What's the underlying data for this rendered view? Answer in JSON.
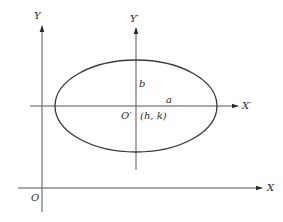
{
  "diagram": {
    "colors": {
      "stroke": "#3a3a3a",
      "axis": "#555555",
      "text": "#2a2a2a",
      "background": "#ffffff"
    },
    "axes": {
      "original_x": {
        "label": "X",
        "y": 188,
        "x_start": 18,
        "x_end": 262
      },
      "original_y": {
        "label": "Y",
        "x": 42,
        "y_start": 212,
        "y_end": 26
      },
      "translated_x": {
        "label": "X′",
        "y": 106,
        "x_start": 30,
        "x_end": 238
      },
      "translated_y": {
        "label": "Y′",
        "x": 136,
        "y_start": 170,
        "y_end": 28
      }
    },
    "ellipse": {
      "cx": 136,
      "cy": 106,
      "rx": 81,
      "ry": 46
    },
    "labels": {
      "origin": "O",
      "new_origin": "O′",
      "center_coords": "(h, k)",
      "semi_major": "a",
      "semi_minor": "b",
      "x_axis": "X",
      "y_axis": "Y",
      "x_prime_axis": "X′",
      "y_prime_axis": "Y′"
    }
  }
}
